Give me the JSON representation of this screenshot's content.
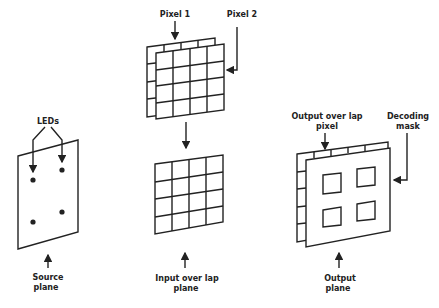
{
  "diagram": {
    "source_plane": {
      "label_line1": "Source",
      "label_line2": "plane",
      "leds_label": "LEDs",
      "led_count": 4
    },
    "pixel_planes": {
      "pixel1_label": "Pixel 1",
      "pixel2_label": "Pixel 2",
      "grid": "4x4"
    },
    "input_overlap_plane": {
      "label_line1": "Input over lap",
      "label_line2": "plane",
      "grid": "4x4"
    },
    "output_plane": {
      "label_line1": "Output",
      "label_line2": "plane",
      "overlap_label_line1": "Output over lap",
      "overlap_label_line2": "pixel",
      "mask_label_line1": "Decoding",
      "mask_label_line2": "mask",
      "window_count": 4
    },
    "colors": {
      "ink": "#222222",
      "background": "#ffffff"
    }
  }
}
